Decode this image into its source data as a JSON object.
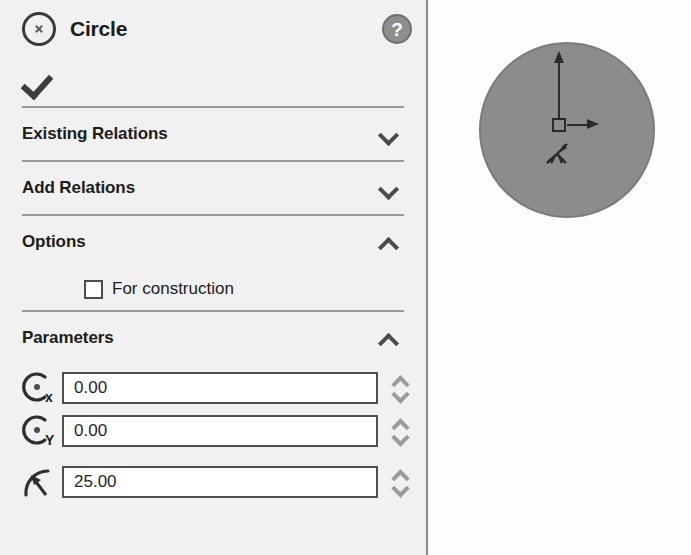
{
  "panel": {
    "icon": "circle-icon",
    "title": "Circle",
    "help_label": "?",
    "ok_label": "",
    "sections": [
      {
        "id": "existing-relations",
        "title": "Existing Relations",
        "expanded": false,
        "chevron": "chevron-down-icon"
      },
      {
        "id": "add-relations",
        "title": "Add Relations",
        "expanded": false,
        "chevron": "chevron-down-icon"
      },
      {
        "id": "options",
        "title": "Options",
        "expanded": true,
        "chevron": "chevron-up-icon"
      },
      {
        "id": "parameters",
        "title": "Parameters",
        "expanded": true,
        "chevron": "chevron-up-icon"
      }
    ],
    "options": {
      "for_construction": {
        "label": "For construction",
        "checked": false
      }
    },
    "parameters": [
      {
        "id": "center-x",
        "icon": "center-x-icon",
        "subscript": "x",
        "value": "0.00"
      },
      {
        "id": "center-y",
        "icon": "center-y-icon",
        "subscript": "Y",
        "value": "0.00"
      },
      {
        "id": "radius",
        "icon": "radius-icon",
        "subscript": "",
        "value": "25.00"
      }
    ]
  },
  "viewport": {
    "name": "graphics-area",
    "sketch": {
      "shape": "circle",
      "fill_color": "#8c8c8c",
      "edge_color": "#7b7b7b"
    },
    "origin": {
      "label": "origin-marker",
      "x_axis": "x-axis-arrow",
      "y_axis": "y-axis-arrow",
      "triad": "view-triad-icon"
    }
  },
  "colors": {
    "panel_bg": "#f1f1f1",
    "text": "#1c1c1c",
    "divider": "#9a9a9a",
    "input_border": "#4f4f4f",
    "spinner": "#9b9b9b"
  }
}
